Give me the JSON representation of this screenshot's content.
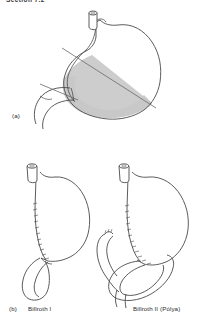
{
  "page": {
    "background_color": "#ffffff",
    "header_fragment": "Section 7.2",
    "width": 205,
    "height": 322
  },
  "figure": {
    "title_clipped": true,
    "line_color": "#4a4a4a",
    "shade_color": "#c8c8c8",
    "panels": [
      {
        "id": "panel-a",
        "label": "(a)",
        "description": "Stomach showing shaded area of resection with diagonal transection lines",
        "has_shaded_resection": true,
        "has_esophageal_stump": true,
        "has_duodenum": true
      },
      {
        "id": "panel-b-billroth-1",
        "label": "(b)",
        "name": "Billroth I",
        "description": "Gastroduodenal anastomosis, stomach remnant joined directly to duodenum",
        "has_suture_line": true
      },
      {
        "id": "panel-b-billroth-2",
        "label": "",
        "name": "Billroth II (Polya)",
        "description": "Gastrojejunal anastomosis with jejunal loop and closed duodenal stump",
        "has_suture_line": true,
        "has_jejunal_loop": true
      }
    ]
  },
  "captions": {
    "a": "(a)",
    "b": "(b)",
    "billroth_1": "Billroth I",
    "billroth_2": "Billroth II (Pólya)"
  }
}
